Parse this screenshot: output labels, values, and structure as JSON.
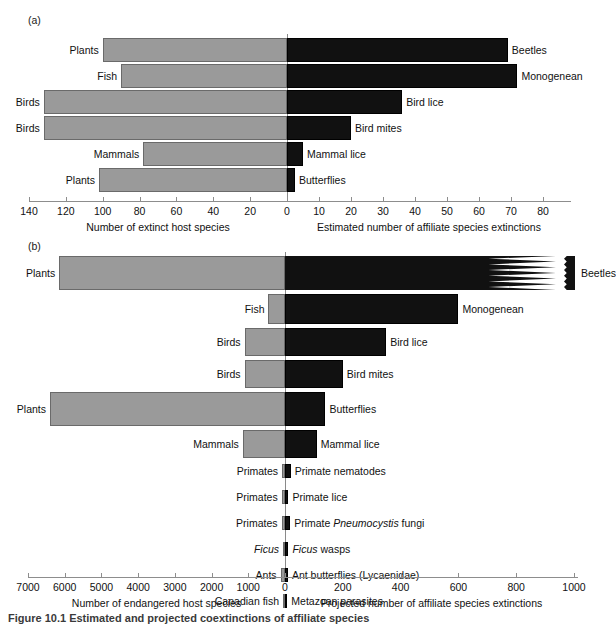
{
  "figure": {
    "caption": "Figure 10.1 Estimated and projected coextinctions of affiliate species"
  },
  "chart_data": [
    {
      "id": "panel-a",
      "type": "bar",
      "orientation": "horizontal-diverging",
      "panel_label": "(a)",
      "left_axis_title": "Number of extinct host species",
      "right_axis_title": "Estimated number of affiliate species extinctions",
      "left_ticks": [
        140,
        120,
        100,
        80,
        60,
        40,
        20,
        0
      ],
      "right_ticks": [
        0,
        10,
        20,
        30,
        40,
        50,
        60,
        70,
        80
      ],
      "left_max": 140,
      "right_max": 80,
      "grid": false,
      "rows": [
        {
          "host": "Plants",
          "affiliate": "Beetles",
          "host_value": 100,
          "affiliate_value": 69
        },
        {
          "host": "Fish",
          "affiliate": "Monogenean",
          "host_value": 90,
          "affiliate_value": 72
        },
        {
          "host": "Birds",
          "affiliate": "Bird lice",
          "host_value": 132,
          "affiliate_value": 36
        },
        {
          "host": "Birds",
          "affiliate": "Bird mites",
          "host_value": 132,
          "affiliate_value": 20
        },
        {
          "host": "Mammals",
          "affiliate": "Mammal lice",
          "host_value": 78,
          "affiliate_value": 5
        },
        {
          "host": "Plants",
          "affiliate": "Butterflies",
          "host_value": 102,
          "affiliate_value": 2.5
        }
      ]
    },
    {
      "id": "panel-b",
      "type": "bar",
      "orientation": "horizontal-diverging",
      "panel_label": "(b)",
      "left_axis_title": "Number of endangered host species",
      "right_axis_title": "Projected number of affiliate species extinctions",
      "left_ticks": [
        7000,
        6000,
        5000,
        4000,
        3000,
        2000,
        1000,
        0
      ],
      "right_ticks": [
        0,
        200,
        400,
        600,
        800,
        1000
      ],
      "left_max": 7000,
      "right_max": 1000,
      "grid": false,
      "rows": [
        {
          "host": "Plants",
          "affiliate": "Beetles",
          "host_value": 6150,
          "affiliate_value": 1000,
          "affiliate_broken": true,
          "affiliate_note": "axis break — value exceeds 1000"
        },
        {
          "host": "Fish",
          "affiliate": "Monogenean",
          "host_value": 450,
          "affiliate_value": 600
        },
        {
          "host": "Birds",
          "affiliate": "Bird lice",
          "host_value": 1100,
          "affiliate_value": 350
        },
        {
          "host": "Birds",
          "affiliate": "Bird mites",
          "host_value": 1100,
          "affiliate_value": 200
        },
        {
          "host": "Plants",
          "affiliate": "Butterflies",
          "host_value": 6400,
          "affiliate_value": 140
        },
        {
          "host": "Mammals",
          "affiliate": "Mammal lice",
          "host_value": 1150,
          "affiliate_value": 110
        },
        {
          "host": "Primates",
          "affiliate": "Primate nematodes",
          "host_value": 80,
          "affiliate_value": 20
        },
        {
          "host": "Primates",
          "affiliate": "Primate lice",
          "host_value": 90,
          "affiliate_value": 12
        },
        {
          "host": "Primates",
          "affiliate": "Primate Pneumocystis fungi",
          "host_value": 95,
          "affiliate_value": 18,
          "affiliate_italic_word": "Pneumocystis"
        },
        {
          "host": "Ficus",
          "affiliate": "Ficus wasps",
          "host_value": 40,
          "affiliate_value": 12,
          "host_italic": true,
          "affiliate_italic_word": "Ficus"
        },
        {
          "host": "Ants",
          "affiliate": "Ant butterflies (Lycaenidae)",
          "host_value": 120,
          "affiliate_value": 10
        },
        {
          "host": "Canadian fish",
          "affiliate": "Metazoan parasites",
          "host_value": 30,
          "affiliate_value": 8
        }
      ]
    }
  ]
}
